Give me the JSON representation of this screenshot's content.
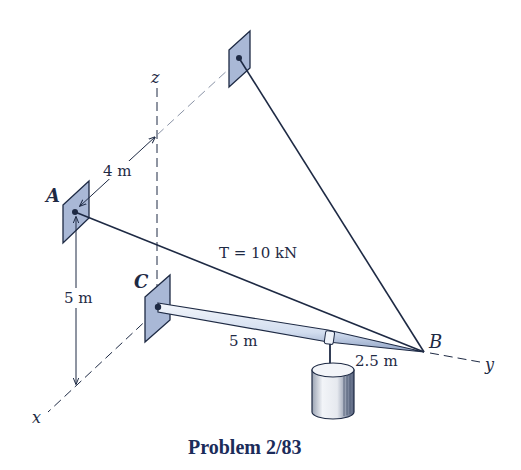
{
  "diagram": {
    "title": "Problem 2/83",
    "axes": {
      "x": "x",
      "y": "y",
      "z": "z"
    },
    "points": {
      "A": "A",
      "B": "B",
      "C": "C"
    },
    "tension_label": "T = 10 kN",
    "dimensions": {
      "A_to_z_axis": "4 m",
      "A_height": "5 m",
      "C_to_collar": "5 m",
      "collar_to_B": "2.5 m"
    },
    "colors": {
      "line": "#1e2a44",
      "plate_fill": "#a9b8d6",
      "plate_edge": "#1e2a44",
      "boom_fill": "#dbe4f2",
      "cylinder_fill": "#e4e8ef",
      "title": "#1b2c5a"
    }
  }
}
